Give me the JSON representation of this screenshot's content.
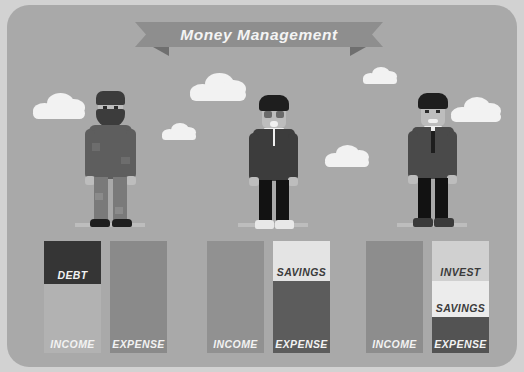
{
  "banner": {
    "title": "Money Management",
    "ribbon_color": "#8e8e8e",
    "ribbon_fold_color": "#6f6f6f",
    "text_color": "#f4f4f4"
  },
  "scene": {
    "background_color": "#a9a9a9",
    "outer_background_color": "#d2d2d2",
    "cloud_color": "#f2f2f2",
    "ground_color": "#bdbdbd"
  },
  "people": [
    {
      "id": "poor-man",
      "description": "bearded man in beanie with patched worn clothing",
      "skin": "#bdbdbd",
      "hat": "#3c3c3c",
      "beard": "#3c3c3c",
      "coat": "#5e5e5e",
      "pants": "#7a7a7a",
      "shoes": "#1e1e1e"
    },
    {
      "id": "middle-class-man",
      "description": "man with glasses wearing jacket, white shirt and sneakers",
      "skin": "#bdbdbd",
      "hair": "#1e1e1e",
      "coat": "#3c3c3c",
      "shirt": "#f0f0f0",
      "pants": "#121212",
      "shoes": "#e8e8e8"
    },
    {
      "id": "businessman",
      "description": "man in business suit with necktie and dress shoes",
      "skin": "#bdbdbd",
      "hair": "#1e1e1e",
      "coat": "#4a4a4a",
      "shirt": "#f0f0f0",
      "tie": "#1e1e1e",
      "pants": "#121212",
      "shoes": "#3a3a3a"
    }
  ],
  "chart_data": {
    "type": "bar",
    "title": "Money Management",
    "xlabel": "",
    "ylabel": "",
    "grid": false,
    "legend": "none",
    "groups": [
      {
        "person": "poor-man",
        "columns": [
          {
            "name": "income-column",
            "segments": [
              {
                "label": "DEBT",
                "value": 38,
                "color": "#353535",
                "label_color": "#f2f2f2"
              },
              {
                "label": "INCOME",
                "value": 62,
                "color": "#b2b2b2",
                "label_color": "#f2f2f2"
              }
            ]
          },
          {
            "name": "expense-column",
            "segments": [
              {
                "label": "EXPENSE",
                "value": 100,
                "color": "#8a8a8a",
                "label_color": "#f2f2f2"
              }
            ]
          }
        ]
      },
      {
        "person": "middle-class-man",
        "columns": [
          {
            "name": "income-column",
            "segments": [
              {
                "label": "INCOME",
                "value": 100,
                "color": "#919191",
                "label_color": "#f2f2f2"
              }
            ]
          },
          {
            "name": "expense-column",
            "segments": [
              {
                "label": "SAVINGS",
                "value": 36,
                "color": "#e4e4e4",
                "label_color": "#3b3b3b"
              },
              {
                "label": "EXPENSE",
                "value": 64,
                "color": "#5c5c5c",
                "label_color": "#f2f2f2"
              }
            ]
          }
        ]
      },
      {
        "person": "businessman",
        "columns": [
          {
            "name": "income-column",
            "segments": [
              {
                "label": "INCOME",
                "value": 100,
                "color": "#8d8d8d",
                "label_color": "#f2f2f2"
              }
            ]
          },
          {
            "name": "expense-column",
            "segments": [
              {
                "label": "INVEST",
                "value": 36,
                "color": "#d0d0d0",
                "label_color": "#3b3b3b"
              },
              {
                "label": "SAVINGS",
                "value": 32,
                "color": "#ececec",
                "label_color": "#3b3b3b"
              },
              {
                "label": "EXPENSE",
                "value": 32,
                "color": "#535353",
                "label_color": "#f2f2f2"
              }
            ]
          }
        ]
      }
    ]
  },
  "clouds": [
    {
      "name": "cloud-1",
      "x": 26,
      "y": 88,
      "w": 52,
      "h": 26
    },
    {
      "name": "cloud-2",
      "x": 183,
      "y": 68,
      "w": 56,
      "h": 28
    },
    {
      "name": "cloud-3",
      "x": 155,
      "y": 118,
      "w": 34,
      "h": 17
    },
    {
      "name": "cloud-4",
      "x": 318,
      "y": 140,
      "w": 44,
      "h": 22
    },
    {
      "name": "cloud-5",
      "x": 356,
      "y": 62,
      "w": 34,
      "h": 17
    },
    {
      "name": "cloud-6",
      "x": 444,
      "y": 92,
      "w": 50,
      "h": 25
    }
  ]
}
